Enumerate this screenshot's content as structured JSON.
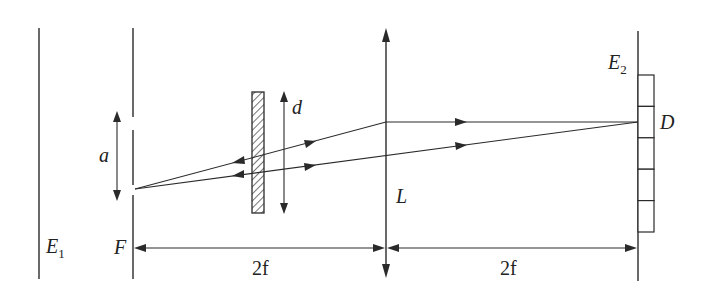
{
  "diagram": {
    "labels": {
      "screen_e1": "E",
      "screen_e1_sub": "1",
      "screen_e2": "E",
      "screen_e2_sub": "2",
      "aperture": "F",
      "slit_width": "a",
      "plate_width": "d",
      "lens": "L",
      "detector_point": "D",
      "distance_left": "2f",
      "distance_right": "2f"
    },
    "colors": {
      "stroke": "#2a2a2a",
      "background": "#ffffff"
    },
    "detector_cells": 5
  }
}
